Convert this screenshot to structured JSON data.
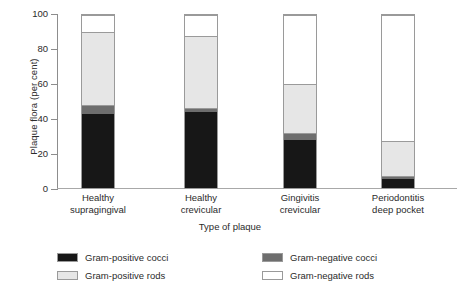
{
  "chart_data": {
    "type": "bar",
    "title": "",
    "subtitle": "",
    "stacked": true,
    "xlabel": "Type of plaque",
    "ylabel": "Plaque flora (per cent)",
    "ylim": [
      0,
      100
    ],
    "yticks": [
      0,
      20,
      40,
      60,
      80,
      100
    ],
    "ytick_labels": [
      "0",
      "20",
      "40",
      "60",
      "80",
      "100"
    ],
    "grid": false,
    "legend_position": "bottom",
    "categories": [
      "Healthy supragingival",
      "Healthy crevicular",
      "Gingivitis crevicular",
      "Periodontitis deep pocket"
    ],
    "category_lines": [
      [
        "Healthy",
        "supragingival"
      ],
      [
        "Healthy",
        "crevicular"
      ],
      [
        "Gingivitis",
        "crevicular"
      ],
      [
        "Periodontitis",
        "deep pocket"
      ]
    ],
    "series": [
      {
        "name": "Gram-positive cocci",
        "color": "#171717",
        "values": [
          43,
          44,
          28,
          5
        ]
      },
      {
        "name": "Gram-negative cocci",
        "color": "#6e6e6e",
        "values": [
          5,
          2.5,
          4,
          2
        ]
      },
      {
        "name": "Gram-positive rods",
        "color": "#e6e6e6",
        "values": [
          42,
          41.5,
          28,
          20
        ]
      },
      {
        "name": "Gram-negative rods",
        "color": "#ffffff",
        "values": [
          10,
          12,
          40,
          73
        ]
      }
    ],
    "cumulative_tops": [
      [
        43,
        48,
        90,
        100
      ],
      [
        44,
        46.5,
        88,
        100
      ],
      [
        28,
        32,
        60,
        100
      ],
      [
        5,
        7,
        27,
        100
      ]
    ]
  },
  "legend": {
    "items": [
      {
        "label": "Gram-positive cocci",
        "swatch": "sw-gpc"
      },
      {
        "label": "Gram-negative cocci",
        "swatch": "sw-gnc"
      },
      {
        "label": "Gram-positive rods",
        "swatch": "sw-gpr"
      },
      {
        "label": "Gram-negative rods",
        "swatch": "sw-gnr"
      }
    ]
  }
}
